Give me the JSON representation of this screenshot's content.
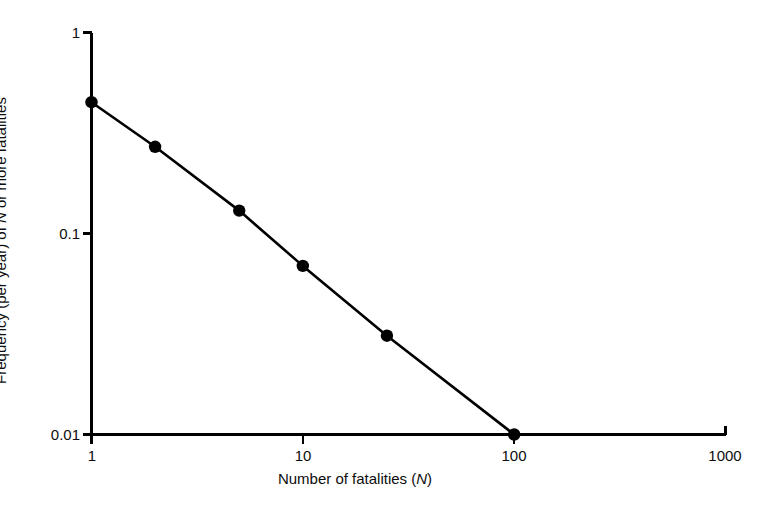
{
  "chart_data": {
    "type": "line",
    "title": "",
    "subtitle": "",
    "xlabel_text": "Number of fatalities (",
    "xlabel_symbol": "N",
    "xlabel_close": ")",
    "ylabel_pre": "Frequency (per year) of ",
    "ylabel_symbol": "N",
    "ylabel_post": " or more fatalities",
    "xscale": "log",
    "yscale": "log",
    "xlim": [
      1,
      1000
    ],
    "ylim": [
      0.01,
      1
    ],
    "grid": false,
    "legend": "none",
    "xticks": [
      {
        "value": 1,
        "label": "1"
      },
      {
        "value": 10,
        "label": "10"
      },
      {
        "value": 100,
        "label": "100"
      },
      {
        "value": 1000,
        "label": "1000"
      }
    ],
    "yticks": [
      {
        "value": 1,
        "label": "1"
      },
      {
        "value": 0.1,
        "label": "0.1"
      },
      {
        "value": 0.01,
        "label": "0.01"
      }
    ],
    "series": [
      {
        "name": "FN curve",
        "marker": "filled-circle",
        "color": "#000000",
        "x": [
          1,
          2,
          5,
          10,
          25,
          100
        ],
        "y": [
          0.45,
          0.27,
          0.13,
          0.069,
          0.031,
          0.01
        ]
      }
    ]
  },
  "figure": {
    "background_color": "#ffffff",
    "line_color": "#000000",
    "axis_color": "#000000"
  }
}
